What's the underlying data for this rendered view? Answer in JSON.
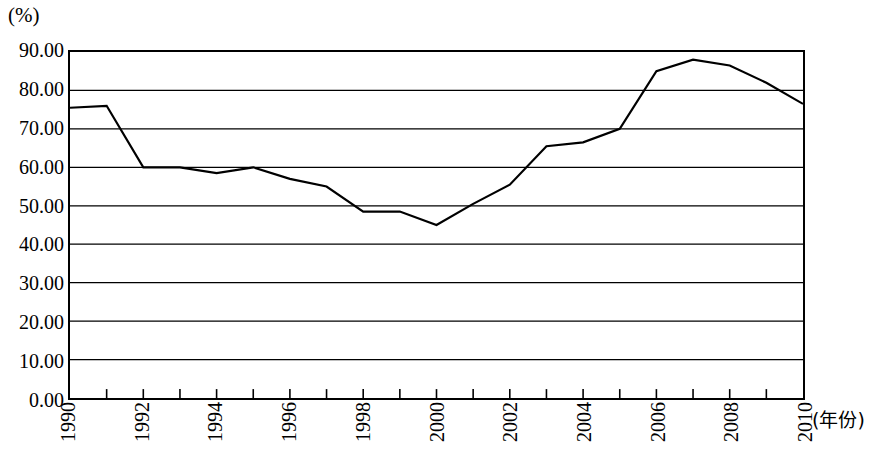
{
  "chart_data": {
    "type": "line",
    "title": "",
    "subtitle": "",
    "xlabel": "(年份)",
    "ylabel": "(%)",
    "x": [
      1990,
      1991,
      1992,
      1993,
      1994,
      1995,
      1996,
      1997,
      1998,
      1999,
      2000,
      2001,
      2002,
      2003,
      2004,
      2005,
      2006,
      2007,
      2008,
      2009,
      2010
    ],
    "series": [
      {
        "name": "",
        "values": [
          75.5,
          76.0,
          60.0,
          60.0,
          58.5,
          60.0,
          57.0,
          55.0,
          48.5,
          48.5,
          45.0,
          50.5,
          55.5,
          65.5,
          66.5,
          70.0,
          85.0,
          88.0,
          86.5,
          82.0,
          76.5
        ]
      }
    ],
    "xlim": [
      1990,
      2010
    ],
    "ylim": [
      0,
      90
    ],
    "y_ticks": [
      0,
      10,
      20,
      30,
      40,
      50,
      60,
      70,
      80,
      90
    ],
    "y_tick_labels": [
      "0.00",
      "10.00",
      "20.00",
      "30.00",
      "40.00",
      "50.00",
      "60.00",
      "70.00",
      "80.00",
      "90.00"
    ],
    "x_tick_labels": [
      "1990",
      "1992",
      "1994",
      "1996",
      "1998",
      "2000",
      "2002",
      "2004",
      "2006",
      "2008",
      "2010"
    ],
    "x_tick_values": [
      1990,
      1992,
      1994,
      1996,
      1998,
      2000,
      2002,
      2004,
      2006,
      2008,
      2010
    ],
    "grid": true,
    "grid_axis": "y",
    "legend": false,
    "legend_position": "none",
    "line_color": "#000000",
    "line_width": 2.2,
    "markers": false,
    "frame_color": "#000000",
    "background_color": "#ffffff"
  }
}
